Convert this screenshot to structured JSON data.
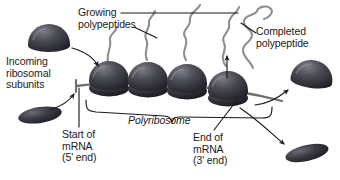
{
  "figure": {
    "background_color": "#ffffff",
    "ink_color": "#1a1a1a",
    "ribosome_dark": "#2b2b2b",
    "ribosome_mid": "#4a4a52",
    "ribosome_light": "#8a8a92",
    "strand_color": "#6e6e72"
  },
  "labels": {
    "growing_polypeptides": "Growing\npolypeptides",
    "completed_polypeptide": "Completed\npolypeptide",
    "incoming_ribosomal_subunits": "Incoming\nribosomal\nsubunits",
    "polyribosome": "Polyribosome",
    "start_of_mrna": "Start of\nmRNA\n(5' end)",
    "end_of_mrna": "End of\nmRNA\n(3' end)"
  },
  "diagram_elements": {
    "ribosome_count_on_mrna": 4,
    "free_large_subunit_count": 2,
    "free_small_subunit_count": 2,
    "growing_polypeptide_chain_count": 4,
    "completed_polypeptide_chain_count": 1,
    "mrna_label_5prime": "5' end",
    "mrna_label_3prime": "3' end"
  }
}
